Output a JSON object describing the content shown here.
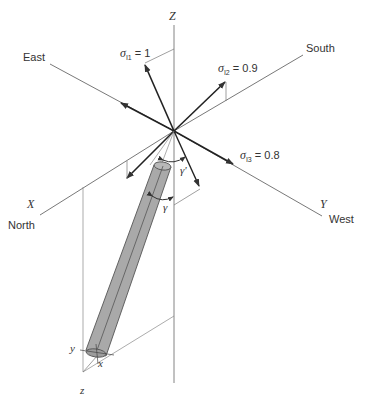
{
  "figure": {
    "axes": {
      "z_label": "Z",
      "x_label": "X",
      "y_label": "Y",
      "directions": {
        "east": "East",
        "south": "South",
        "north": "North",
        "west": "West"
      }
    },
    "stresses": [
      {
        "symbol": "σ",
        "subscript": "I1",
        "equals": " = 1"
      },
      {
        "symbol": "σ",
        "subscript": "I2",
        "equals": " = 0.9"
      },
      {
        "symbol": "σ",
        "subscript": "I3",
        "equals": " = 0.8"
      }
    ],
    "angles": {
      "gamma_prime": "γ'",
      "gamma": "γ"
    },
    "pipe_local_axes": {
      "x": "x",
      "y": "y",
      "z": "z"
    },
    "colors": {
      "line": "#444444",
      "thin_line": "#888888",
      "pipe_fill": "#a8a8a8",
      "pipe_stroke": "#555555"
    }
  }
}
